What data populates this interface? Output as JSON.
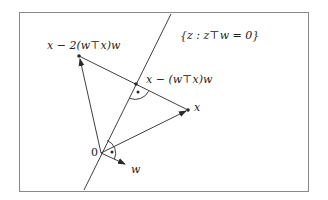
{
  "diagram": {
    "type": "geometric-reflection",
    "frame": {
      "x": 19,
      "y": 12,
      "w": 289,
      "h": 179,
      "stroke": "#8a8a8a"
    },
    "stroke_color": "#2a2a2a",
    "points": {
      "origin": {
        "x": 101,
        "y": 153
      },
      "x": {
        "x": 188,
        "y": 110
      },
      "projection": {
        "x": 136,
        "y": 84
      },
      "reflection": {
        "x": 79,
        "y": 56
      },
      "w_tip": {
        "x": 125,
        "y": 164
      }
    },
    "hyperplane": {
      "x1": 171,
      "y1": 14,
      "x2": 84,
      "y2": 190
    },
    "labels": {
      "hyperplane": "{z : z⊤w = 0}",
      "reflection": "x − 2(w⊤x)w",
      "projection": "x − (w⊤x)w",
      "x": "x",
      "origin": "0",
      "w": "w"
    },
    "right_angle_markers": [
      {
        "at": "projection",
        "meaning": "perpendicular between hyperplane and segment x-reflection"
      },
      {
        "at": "origin",
        "meaning": "w is normal to hyperplane"
      }
    ]
  }
}
